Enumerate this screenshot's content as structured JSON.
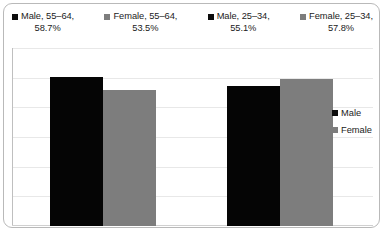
{
  "chart_data": {
    "type": "bar",
    "title": "",
    "xlabel": "",
    "ylabel": "",
    "categories": [
      "55–64",
      "25–34"
    ],
    "series": [
      {
        "name": "Male",
        "values": [
          58.7,
          55.1
        ],
        "color": "#050505"
      },
      {
        "name": "Female",
        "values": [
          53.5,
          57.8
        ],
        "color": "#7d7d7d"
      }
    ],
    "ylim": [
      0,
      70
    ],
    "grid": true,
    "gridline_count": 6,
    "legend_position": [
      "top",
      "right"
    ],
    "data_labels": [
      "58.7%",
      "53.5%",
      "55.1%",
      "57.8%"
    ]
  },
  "top_legend": {
    "entries": [
      {
        "swatch": "male-swatch",
        "line1": "Male, 55–64,",
        "line2": "58.7%"
      },
      {
        "swatch": "female-swatch",
        "line1": "Female, 55–64,",
        "line2": "53.5%"
      },
      {
        "swatch": "male-swatch",
        "line1": "Male, 25–34,",
        "line2": "55.1%"
      },
      {
        "swatch": "female-swatch",
        "line1": "Female, 25–34,",
        "line2": "57.8%"
      }
    ]
  },
  "right_legend": {
    "entries": [
      {
        "swatch": "male-swatch",
        "label": "Male"
      },
      {
        "swatch": "female-swatch",
        "label": "Female"
      }
    ]
  },
  "colors": {
    "male": "#050505",
    "female": "#7d7d7d",
    "gridline": "#e8e8e8",
    "frame_border": "#b9b9b9",
    "background": "#ffffff"
  }
}
